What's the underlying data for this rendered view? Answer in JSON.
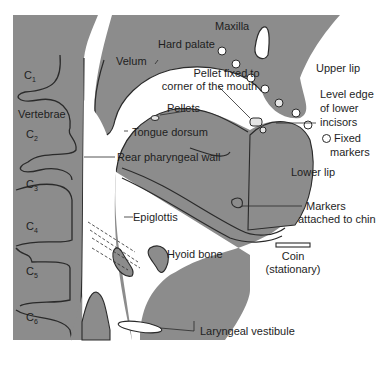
{
  "figure": {
    "colors": {
      "tissue": "#8c8c8c",
      "outline": "#2a2a2a",
      "background": "#ffffff",
      "text": "#1e1e1e"
    },
    "vertebrae": {
      "group_label": "Vertebrae",
      "items": [
        {
          "letter": "C",
          "sub": "1"
        },
        {
          "letter": "C",
          "sub": "2"
        },
        {
          "letter": "C",
          "sub": "3"
        },
        {
          "letter": "C",
          "sub": "4"
        },
        {
          "letter": "C",
          "sub": "5"
        },
        {
          "letter": "C",
          "sub": "6"
        }
      ]
    },
    "labels": {
      "maxilla": "Maxilla",
      "hard_palate": "Hard palate",
      "velum": "Velum",
      "pellet_fixed_1": "Pellet fixed to",
      "pellet_fixed_2": "corner of the mouth",
      "pellets": "Pellets",
      "tongue_dorsum": "Tongue dorsum",
      "rear_pharyngeal_wall": "Rear pharyngeal wall",
      "upper_lip": "Upper lip",
      "level_edge_1": "Level edge",
      "level_edge_2": "of lower",
      "level_edge_3": "incisors",
      "fixed_markers_1": "Fixed",
      "fixed_markers_2": "markers",
      "lower_lip": "Lower lip",
      "markers_chin_1": "Markers",
      "markers_chin_2": "attached to chin",
      "epiglottis": "Epiglottis",
      "hyoid_bone": "Hyoid bone",
      "coin_1": "Coin",
      "coin_2": "(stationary)",
      "laryngeal_vestibule": "Laryngeal vestibule"
    }
  }
}
